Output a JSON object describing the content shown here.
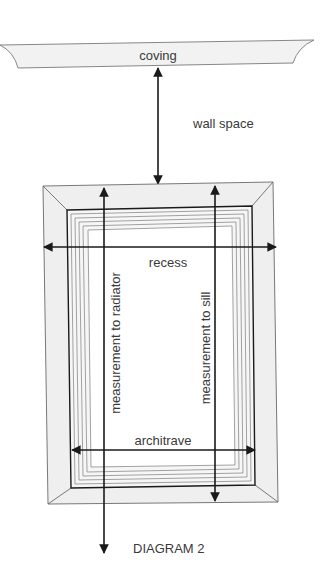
{
  "diagram": {
    "caption": "DIAGRAM 2",
    "labels": {
      "coving": "coving",
      "wall_space": "wall space",
      "recess": "recess",
      "architrave": "architrave",
      "measurement_to_radiator": "measurement to radiator",
      "measurement_to_sill": "measurement to sill"
    },
    "colors": {
      "line": "#1a1a1a",
      "fill": "#f0f0f0",
      "grey_line": "#8a8a8a",
      "text": "#3a3a3a"
    }
  }
}
